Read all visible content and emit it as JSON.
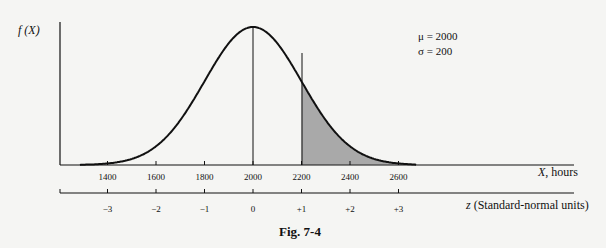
{
  "chart_data": {
    "type": "area",
    "title": "Fig. 7-4",
    "ylabel": "f(X)",
    "xlabel": "X, hours",
    "z_axis_label": "z (Standard-normal units)",
    "x_ticks": [
      1400,
      1600,
      1800,
      2000,
      2200,
      2400,
      2600
    ],
    "z_ticks": [
      "-3",
      "-2",
      "-1",
      "0",
      "+1",
      "+2",
      "+3"
    ],
    "distribution": "normal",
    "mean": 2000,
    "std_dev": 200,
    "shaded_region": {
      "from": 2200,
      "to": 2700,
      "color": "#a9a9a9"
    },
    "annotations": [
      "μ = 2000",
      "σ = 200"
    ],
    "mean_line_at": 2000,
    "grid": false
  },
  "labels": {
    "ylabel": "f (X)",
    "xlabel_var": "X",
    "xlabel_rest": ", hours",
    "zlabel_var": "z",
    "zlabel_rest": " (Standard-normal units)",
    "mu": "μ  = 2000",
    "sigma": "σ  = 200",
    "caption": "Fig. 7-4",
    "x_ticks": [
      "1400",
      "1600",
      "1800",
      "2000",
      "2200",
      "2400",
      "2600"
    ],
    "z_ticks": [
      "−3",
      "−2",
      "−1",
      "0",
      "+1",
      "+2",
      "+3"
    ]
  }
}
